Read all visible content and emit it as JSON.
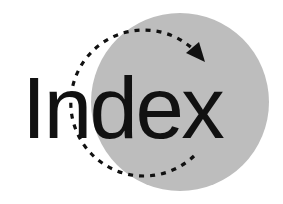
{
  "logo": {
    "word": "Index",
    "icons": [
      "gray-circle",
      "dashed-circular-arrow"
    ],
    "colors": {
      "background": "#ffffff",
      "circle": "#bdbdbd",
      "text": "#111111",
      "arrow": "#111111"
    }
  }
}
